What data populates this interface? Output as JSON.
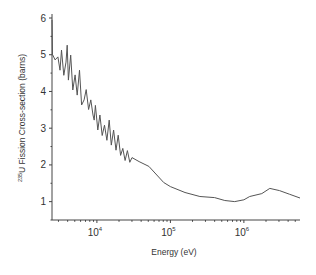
{
  "chart_data": {
    "type": "line",
    "title": "",
    "xlabel": "Energy (eV)",
    "ylabel_superscript": "235",
    "ylabel": "U Fission Cross-section (barns)",
    "xscale": "log",
    "xlim": [
      2450,
      5800000
    ],
    "ylim": [
      0.5,
      6
    ],
    "yticks": [
      1,
      2,
      3,
      4,
      5,
      6
    ],
    "ytick_labels": [
      "1",
      "2",
      "3",
      "4",
      "5",
      "6"
    ],
    "xticks": [
      10000,
      100000,
      1000000
    ],
    "xtick_labels": [
      {
        "base": "10",
        "exp": "4"
      },
      {
        "base": "10",
        "exp": "5"
      },
      {
        "base": "10",
        "exp": "6"
      }
    ],
    "grid": false,
    "legend": "none",
    "line_color": "#555555",
    "series": [
      {
        "name": "235U fission cross-section",
        "x": [
          2450,
          2480,
          2500,
          2700,
          2950,
          3150,
          3300,
          3550,
          3800,
          3950,
          4100,
          4400,
          4700,
          5050,
          5400,
          5800,
          6200,
          6700,
          7150,
          7700,
          8250,
          8850,
          9200,
          9550,
          10300,
          11000,
          11800,
          12700,
          13700,
          14700,
          15700,
          16900,
          18200,
          19500,
          21000,
          22500,
          24200,
          26000,
          28000,
          30000,
          37500,
          51000,
          81000,
          100000,
          158000,
          252000,
          400000,
          550000,
          750000,
          1000000,
          1200000,
          1750000,
          2250000,
          3050000,
          4200000,
          5800000
        ],
        "y": [
          5.95,
          5.0,
          5.0,
          4.86,
          4.94,
          4.58,
          5.13,
          4.44,
          4.8,
          5.26,
          4.31,
          4.99,
          4.04,
          4.45,
          3.9,
          4.58,
          3.63,
          3.77,
          4.05,
          3.51,
          3.77,
          3.36,
          3.22,
          3.62,
          2.95,
          3.36,
          2.8,
          3.08,
          2.67,
          3.22,
          2.54,
          2.95,
          2.4,
          2.81,
          2.26,
          2.45,
          2.12,
          2.39,
          2.07,
          2.2,
          2.09,
          1.96,
          1.52,
          1.41,
          1.25,
          1.14,
          1.11,
          1.03,
          1.0,
          1.05,
          1.14,
          1.22,
          1.36,
          1.3,
          1.2,
          1.1
        ]
      }
    ]
  }
}
